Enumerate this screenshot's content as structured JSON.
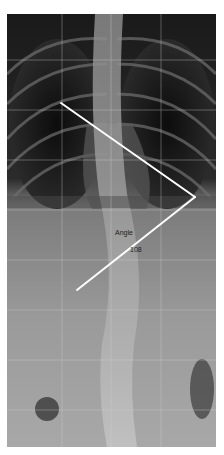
{
  "image": {
    "description": "Frontal spine X-ray (radiograph) with angle measurement overlay",
    "grid": {
      "columns": 4,
      "rows": 9,
      "color": "#c8c8c8"
    },
    "measurement": {
      "type": "angle",
      "label": "Angle",
      "value": "108",
      "line_color": "#ffffff",
      "points": {
        "upper_end": [
          61,
          103
        ],
        "vertex": [
          195,
          197
        ],
        "lower_end": [
          77,
          290
        ]
      }
    },
    "colors": {
      "thorax_dark": "#1e1e1e",
      "abdomen": "#8f8f8f",
      "spine": "#b5b5b5",
      "background": "#ffffff"
    }
  }
}
